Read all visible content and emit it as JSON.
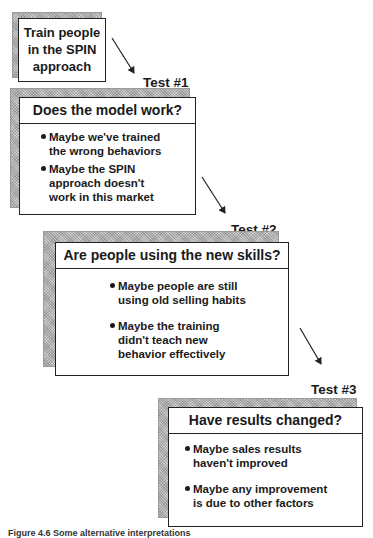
{
  "diagram": {
    "start_box": {
      "lines": [
        "Train people",
        "in the SPIN",
        "approach"
      ]
    },
    "tests": [
      {
        "label": "Test #1",
        "question": "Does the model work?",
        "bullets": [
          [
            "Maybe we've trained",
            "the wrong behaviors"
          ],
          [
            "Maybe the SPIN",
            "approach doesn't",
            "work in  this market"
          ]
        ]
      },
      {
        "label": "Test #2",
        "question": "Are people using the new skills?",
        "bullets": [
          [
            "Maybe people are still",
            "using old selling habits"
          ],
          [
            "Maybe the training",
            "didn't teach new",
            "behavior effectively"
          ]
        ]
      },
      {
        "label": "Test #3",
        "question": "Have results changed?",
        "bullets": [
          [
            "Maybe sales results",
            "haven't improved"
          ],
          [
            "Maybe any improvement",
            "is due to other factors"
          ]
        ]
      }
    ],
    "caption": "Figure 4.6  Some alternative interpretations",
    "colors": {
      "line": "#222222",
      "shadow": "#cfcfcf",
      "box_fill": "#ffffff"
    }
  }
}
